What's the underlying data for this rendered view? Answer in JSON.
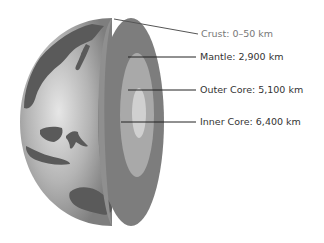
{
  "diagram": {
    "labels": [
      {
        "key": "crust",
        "text": "Crust: 0–50 km"
      },
      {
        "key": "mantle",
        "text": "Mantle: 2,900 km"
      },
      {
        "key": "outer_core",
        "text": "Outer Core: 5,100 km"
      },
      {
        "key": "inner_core",
        "text": "Inner Core: 6,400 km"
      }
    ],
    "colors": {
      "ocean_light": "#d8d8d8",
      "ocean_dark": "#8a8a8a",
      "land": "#555555",
      "mantle": "#7a7a7a",
      "outer_core": "#a8a8a8",
      "inner_core": "#cfcfcf",
      "leader_line": "#222222"
    }
  }
}
